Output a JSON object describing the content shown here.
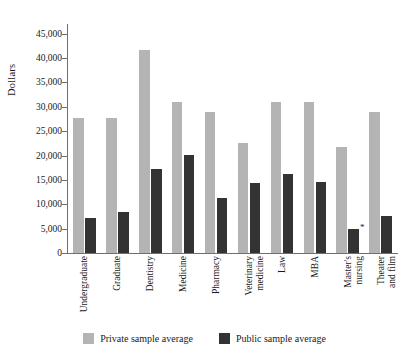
{
  "chart_data": {
    "type": "bar",
    "title": "",
    "xlabel": "",
    "ylabel": "Dollars",
    "ylim": [
      0,
      47000
    ],
    "yticks": [
      0,
      5000,
      10000,
      15000,
      20000,
      25000,
      30000,
      35000,
      40000,
      45000
    ],
    "ytick_labels": [
      "0",
      "5,000",
      "10,000",
      "15,000",
      "20,000",
      "25,000",
      "30,000",
      "35,000",
      "40,000",
      "45,000"
    ],
    "grid": false,
    "legend_position": "bottom",
    "categories": [
      "Undergraduate",
      "Graduate",
      "Dentistry",
      "Medicine",
      "Pharmacy",
      "Veterinary medicine",
      "Law",
      "MBA",
      "Master's nursing",
      "Theater and film"
    ],
    "category_lines": [
      [
        "Undergraduate"
      ],
      [
        "Graduate"
      ],
      [
        "Dentistry"
      ],
      [
        "Medicine"
      ],
      [
        "Pharmacy"
      ],
      [
        "Veterinary",
        "medicine"
      ],
      [
        "Law"
      ],
      [
        "MBA"
      ],
      [
        "Master's",
        "nursing"
      ],
      [
        "Theater",
        "and film"
      ]
    ],
    "series": [
      {
        "name": "Private sample average",
        "color": "#b4b4b4",
        "values": [
          27700,
          27700,
          41600,
          31000,
          29000,
          22600,
          31000,
          31000,
          21800,
          29000
        ]
      },
      {
        "name": "Public sample average",
        "color": "#333333",
        "values": [
          7100,
          8400,
          17200,
          20200,
          11200,
          14300,
          16300,
          14600,
          4900,
          7500
        ]
      }
    ],
    "annotations": [
      {
        "text": "*",
        "category": "Master's nursing",
        "series": "Public sample average"
      }
    ]
  },
  "legend": {
    "items": [
      {
        "label": "Private sample average",
        "color": "#b4b4b4",
        "key": "private"
      },
      {
        "label": "Public sample average",
        "color": "#333333",
        "key": "public"
      }
    ]
  },
  "axis": {
    "y_title": "Dollars"
  }
}
